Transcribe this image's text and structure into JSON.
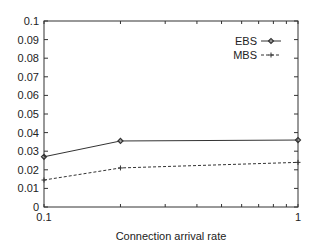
{
  "chart_data": {
    "type": "line",
    "title": "",
    "xlabel": "Connection arrival rate",
    "ylabel": "",
    "xscale": "log",
    "xlim": [
      0.1,
      1
    ],
    "ylim": [
      0,
      0.1
    ],
    "x_tick_labels": [
      "0.1",
      "1"
    ],
    "y_tick_labels": [
      "0",
      "0.01",
      "0.02",
      "0.03",
      "0.04",
      "0.05",
      "0.06",
      "0.07",
      "0.08",
      "0.09",
      "0.1"
    ],
    "legend_position": "top-right",
    "grid": false,
    "x": [
      0.1,
      0.2,
      1
    ],
    "series": [
      {
        "name": "EBS",
        "values": [
          0.027,
          0.0355,
          0.036
        ],
        "style": "solid",
        "marker": "diamond",
        "color": "#333333"
      },
      {
        "name": "MBS",
        "values": [
          0.0145,
          0.021,
          0.024
        ],
        "style": "dashed",
        "marker": "plus",
        "color": "#333333"
      }
    ]
  }
}
